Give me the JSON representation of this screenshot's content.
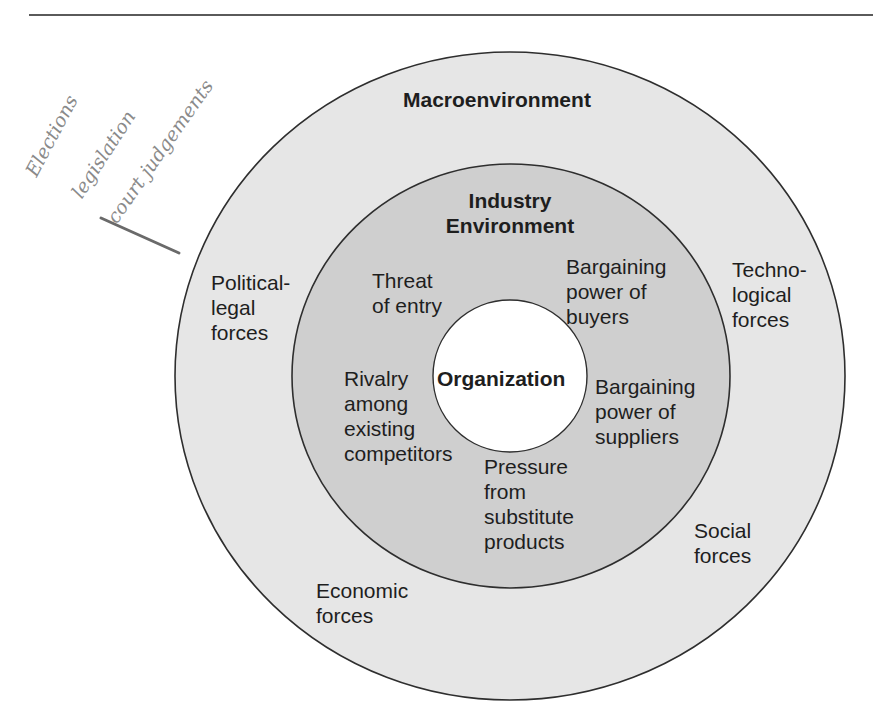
{
  "figure": {
    "rings": {
      "outer": {
        "name": "Macroenvironment",
        "fill": "#e6e6e6"
      },
      "middle": {
        "name": "Industry Environment",
        "fill": "#cfcfcf"
      },
      "inner": {
        "name": "Organization",
        "fill": "#ffffff"
      },
      "stroke": "#2e2e2e"
    },
    "titles": {
      "macro": "Macroenvironment",
      "industry_line1": "Industry",
      "industry_line2": "Environment",
      "organization": "Organization"
    },
    "macro_forces": {
      "political": [
        "Political-",
        "legal",
        "forces"
      ],
      "technological": [
        "Techno-",
        "logical",
        "forces"
      ],
      "social": [
        "Social",
        "forces"
      ],
      "economic": [
        "Economic",
        "forces"
      ]
    },
    "industry_forces": {
      "threat_of_entry": [
        "Threat",
        "of entry"
      ],
      "buyers": [
        "Bargaining",
        "power of",
        "buyers"
      ],
      "rivalry": [
        "Rivalry",
        "among",
        "existing",
        "competitors"
      ],
      "suppliers": [
        "Bargaining",
        "power of",
        "suppliers"
      ],
      "substitutes": [
        "Pressure",
        "from",
        "substitute",
        "products"
      ]
    },
    "handwritten_notes": [
      "Elections",
      "legislation",
      "court judgements"
    ]
  }
}
